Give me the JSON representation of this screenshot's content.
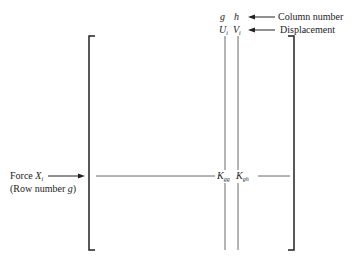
{
  "header": {
    "col_g": "g",
    "col_h": "h",
    "disp_g": "U",
    "disp_g_sub": "i",
    "disp_h": "V",
    "disp_h_sub": "i",
    "column_label": "Column number",
    "displacement_label": "Displacement"
  },
  "row": {
    "force_label": "Force ",
    "force_var": "X",
    "force_sub": "i",
    "row_label": "(Row number ",
    "row_var": "g",
    "row_close": ")"
  },
  "matrix": {
    "kgg": "K",
    "kgg_sub": "gg",
    "kgh": "K",
    "kgh_sub": "gh"
  }
}
